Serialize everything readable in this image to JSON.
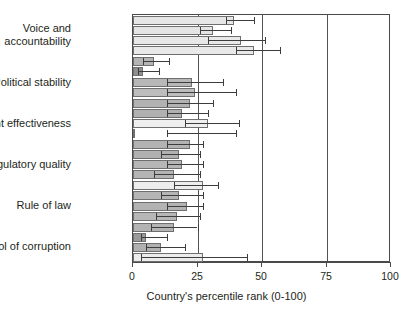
{
  "chart_data": {
    "type": "bar",
    "orientation": "horizontal",
    "title": "",
    "xlabel": "Country's percentile rank (0-100)",
    "ylabel": "",
    "xlim": [
      0,
      100
    ],
    "xticks": [
      0,
      25,
      50,
      75,
      100
    ],
    "xticklabels": [
      "0",
      "25",
      "50",
      "75",
      "100"
    ],
    "grid": "vertical gridlines at 25, 50, 75",
    "legend": "none",
    "categories": [
      "Voice and accountability",
      "Political stability",
      "Government effectiveness",
      "Regulatory quality",
      "Rule of law",
      "Control of corruption"
    ],
    "groups": [
      {
        "category": "Voice and accountability",
        "bars": [
          {
            "value": 39,
            "err_low": 36,
            "err_high": 47,
            "shade": "#e6e6e6"
          },
          {
            "value": 31,
            "err_low": 26,
            "err_high": 38,
            "shade": "#e4e4e4"
          },
          {
            "value": 42,
            "err_low": 29,
            "err_high": 51,
            "shade": "#e8e8e8"
          },
          {
            "value": 47,
            "err_low": 40,
            "err_high": 57,
            "shade": "#e9e9e9"
          }
        ]
      },
      {
        "category": "Political stability",
        "bars": [
          {
            "value": 8,
            "err_low": 4,
            "err_high": 14,
            "shade": "#b4b4b4"
          },
          {
            "value": 4,
            "err_low": 2,
            "err_high": 10,
            "shade": "#8f8f8f"
          },
          {
            "value": 23,
            "err_low": 13,
            "err_high": 35,
            "shade": "#b8b8b8"
          },
          {
            "value": 24,
            "err_low": 13,
            "err_high": 40,
            "shade": "#bdbdbd"
          }
        ]
      },
      {
        "category": "Government effectiveness",
        "bars": [
          {
            "value": 22,
            "err_low": 13,
            "err_high": 31,
            "shade": "#b2b2b2"
          },
          {
            "value": 19,
            "err_low": 13,
            "err_high": 29,
            "shade": "#b0b0b0"
          },
          {
            "value": 29,
            "err_low": 20,
            "err_high": 41,
            "shade": "#efefef"
          },
          {
            "value": 0,
            "err_low": 13,
            "err_high": 40,
            "shade": "#f1f1f1"
          }
        ]
      },
      {
        "category": "Regulatory quality",
        "bars": [
          {
            "value": 22,
            "err_low": 13,
            "err_high": 27,
            "shade": "#b3b3b3"
          },
          {
            "value": 18,
            "err_low": 11,
            "err_high": 26,
            "shade": "#b1b1b1"
          },
          {
            "value": 19,
            "err_low": 13,
            "err_high": 27,
            "shade": "#b6b6b6"
          },
          {
            "value": 16,
            "err_low": 8,
            "err_high": 26,
            "shade": "#b4b4b4"
          }
        ]
      },
      {
        "category": "Rule of law",
        "bars": [
          {
            "value": 27,
            "err_low": 16,
            "err_high": 33,
            "shade": "#ededed"
          },
          {
            "value": 18,
            "err_low": 11,
            "err_high": 27,
            "shade": "#b5b5b5"
          },
          {
            "value": 21,
            "err_low": 13,
            "err_high": 27,
            "shade": "#b3b3b3"
          },
          {
            "value": 17,
            "err_low": 9,
            "err_high": 26,
            "shade": "#b7b7b7"
          }
        ]
      },
      {
        "category": "Control of corruption",
        "bars": [
          {
            "value": 16,
            "err_low": 7,
            "err_high": 25,
            "shade": "#b4b4b4"
          },
          {
            "value": 5,
            "err_low": 3,
            "err_high": 13,
            "shade": "#9a9a9a"
          },
          {
            "value": 11,
            "err_low": 5,
            "err_high": 20,
            "shade": "#b0b0b0"
          },
          {
            "value": 27,
            "err_low": 3,
            "err_high": 44,
            "shade": "#ececec"
          }
        ]
      }
    ]
  },
  "axis": {
    "x_title": "Country's percentile rank (0-100)",
    "tick_0": "0",
    "tick_25": "25",
    "tick_50": "50",
    "tick_75": "75",
    "tick_100": "100"
  },
  "ylabels": {
    "voice": "Voice and\naccountability",
    "voice_line1": "Voice and",
    "voice_line2": "accountability",
    "political": "Political stability",
    "government": "Government effectiveness",
    "regulatory": "Regulatory quality",
    "rule": "Rule of law",
    "corruption": "Control of corruption"
  },
  "colors": {
    "frame": "#4a4a4a",
    "gridline": "#55515a",
    "error_bar": "#3d3d3d",
    "text": "#231f20",
    "background": "#ffffff"
  }
}
